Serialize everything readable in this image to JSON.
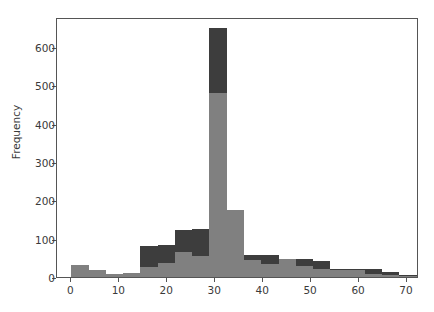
{
  "chart_data": {
    "type": "bar",
    "subtype": "histogram-overlapping",
    "title": "",
    "xlabel": "",
    "ylabel": "Frequency",
    "xlim": [
      -3.0,
      72.5
    ],
    "ylim": [
      0,
      678
    ],
    "xticks": [
      0,
      10,
      20,
      30,
      40,
      50,
      60,
      70
    ],
    "xtick_labels": [
      "0",
      "10",
      "20",
      "30",
      "40",
      "50",
      "60",
      "70"
    ],
    "yticks": [
      0,
      100,
      200,
      300,
      400,
      500,
      600
    ],
    "ytick_labels": [
      "0",
      "100",
      "200",
      "300",
      "400",
      "500",
      "600"
    ],
    "grid": false,
    "legend": null,
    "bin_width": 3.6,
    "bin_starts": [
      0.0,
      3.6,
      7.2,
      10.8,
      14.4,
      18.0,
      21.6,
      25.2,
      28.8,
      32.4,
      36.0,
      39.6,
      43.2,
      46.8,
      50.4,
      54.0,
      57.6,
      61.2,
      64.8,
      68.4
    ],
    "series": [
      {
        "name": "series-dark",
        "color": "#3d3d3d",
        "values": [
          32,
          17,
          9,
          10,
          80,
          83,
          122,
          126,
          650,
          45,
          57,
          57,
          48,
          48,
          42,
          20,
          20,
          20,
          12,
          5
        ]
      },
      {
        "name": "series-gray",
        "color": "#808080",
        "values": [
          32,
          17,
          9,
          10,
          27,
          37,
          65,
          55,
          480,
          175,
          45,
          34,
          47,
          28,
          22,
          19,
          19,
          9,
          6,
          3
        ]
      }
    ]
  },
  "axes": {
    "y_axis_label": "Frequency",
    "frame_color": "#555555",
    "background": "#ffffff"
  }
}
